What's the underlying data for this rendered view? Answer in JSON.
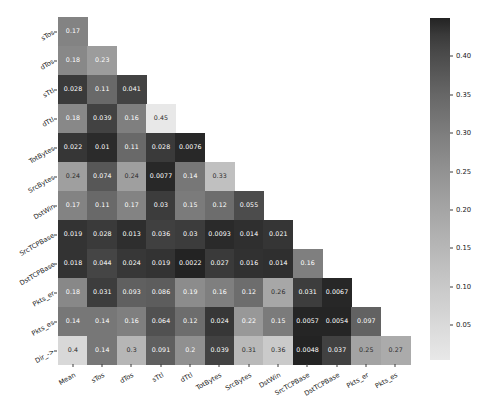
{
  "chart_data": {
    "type": "heatmap",
    "title": "",
    "xlabel": "",
    "ylabel": "",
    "grid": false,
    "legend_position": "right",
    "triangular": "lower",
    "colormap": "gray",
    "colorbar": {
      "ticks": [
        "0.05",
        "0.10",
        "0.15",
        "0.20",
        "0.25",
        "0.30",
        "0.35",
        "0.40"
      ],
      "tick_values": [
        0.05,
        0.1,
        0.15,
        0.2,
        0.25,
        0.3,
        0.35,
        0.4
      ],
      "vmin": 0.0048,
      "vmax": 0.45,
      "low_color": "#232323",
      "high_color": "#e8e8e8"
    },
    "x_categories": [
      "Mean",
      "sTos",
      "dTos",
      "sTtl",
      "dTtl",
      "TotBytes",
      "SrcBytes",
      "DstWin",
      "SrcTCPBase",
      "DstTCPBase",
      "Pkts_er",
      "Pkts_es"
    ],
    "y_categories": [
      "sTos",
      "dTos",
      "sTtl",
      "dTtl",
      "TotBytes",
      "SrcBytes",
      "DstWin",
      "SrcTCPBase",
      "DstTCPBase",
      "Pkts_er",
      "Pkts_es",
      "Dir_->"
    ],
    "rows": [
      {
        "label": "sTos",
        "values": [
          0.17
        ],
        "labels": [
          "0.17"
        ]
      },
      {
        "label": "dTos",
        "values": [
          0.18,
          0.23
        ],
        "labels": [
          "0.18",
          "0.23"
        ]
      },
      {
        "label": "sTtl",
        "values": [
          0.028,
          0.11,
          0.041
        ],
        "labels": [
          "0.028",
          "0.11",
          "0.041"
        ]
      },
      {
        "label": "dTtl",
        "values": [
          0.18,
          0.039,
          0.16,
          0.45
        ],
        "labels": [
          "0.18",
          "0.039",
          "0.16",
          "0.45"
        ]
      },
      {
        "label": "TotBytes",
        "values": [
          0.022,
          0.01,
          0.11,
          0.028,
          0.0076
        ],
        "labels": [
          "0.022",
          "0.01",
          "0.11",
          "0.028",
          "0.0076"
        ]
      },
      {
        "label": "SrcBytes",
        "values": [
          0.24,
          0.074,
          0.24,
          0.0077,
          0.14,
          0.33
        ],
        "labels": [
          "0.24",
          "0.074",
          "0.24",
          "0.0077",
          "0.14",
          "0.33"
        ]
      },
      {
        "label": "DstWin",
        "values": [
          0.17,
          0.11,
          0.17,
          0.03,
          0.15,
          0.12,
          0.055
        ],
        "labels": [
          "0.17",
          "0.11",
          "0.17",
          "0.03",
          "0.15",
          "0.12",
          "0.055"
        ]
      },
      {
        "label": "SrcTCPBase",
        "values": [
          0.019,
          0.028,
          0.013,
          0.036,
          0.03,
          0.0093,
          0.014,
          0.021
        ],
        "labels": [
          "0.019",
          "0.028",
          "0.013",
          "0.036",
          "0.03",
          "0.0093",
          "0.014",
          "0.021"
        ]
      },
      {
        "label": "DstTCPBase",
        "values": [
          0.018,
          0.044,
          0.024,
          0.019,
          0.0022,
          0.027,
          0.016,
          0.014,
          0.16
        ],
        "labels": [
          "0.018",
          "0.044",
          "0.024",
          "0.019",
          "0.0022",
          "0.027",
          "0.016",
          "0.014",
          "0.16"
        ]
      },
      {
        "label": "Pkts_er",
        "values": [
          0.18,
          0.031,
          0.093,
          0.086,
          0.19,
          0.16,
          0.12,
          0.26,
          0.031,
          0.0067
        ],
        "labels": [
          "0.18",
          "0.031",
          "0.093",
          "0.086",
          "0.19",
          "0.16",
          "0.12",
          "0.26",
          "0.031",
          "0.0067"
        ]
      },
      {
        "label": "Pkts_es",
        "values": [
          0.14,
          0.14,
          0.16,
          0.064,
          0.12,
          0.024,
          0.22,
          0.15,
          0.0057,
          0.0054,
          0.097
        ],
        "labels": [
          "0.14",
          "0.14",
          "0.16",
          "0.064",
          "0.12",
          "0.024",
          "0.22",
          "0.15",
          "0.0057",
          "0.0054",
          "0.097"
        ]
      },
      {
        "label": "Dir_->",
        "values": [
          0.4,
          0.14,
          0.3,
          0.091,
          0.2,
          0.039,
          0.31,
          0.36,
          0.0048,
          0.037,
          0.25,
          0.27
        ],
        "labels": [
          "0.4",
          "0.14",
          "0.3",
          "0.091",
          "0.2",
          "0.039",
          "0.31",
          "0.36",
          "0.0048",
          "0.037",
          "0.25",
          "0.27"
        ]
      }
    ]
  }
}
